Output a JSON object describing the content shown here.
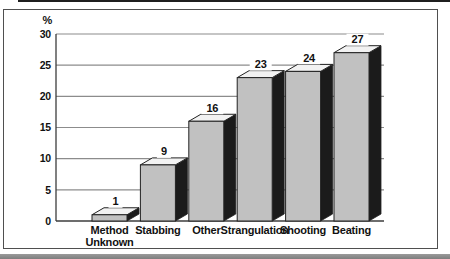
{
  "figure": {
    "kind": "scanned-statistical-figure",
    "y_unit_label": "%"
  },
  "chart_data": {
    "type": "bar",
    "categories": [
      "Method Unknown",
      "Stabbing",
      "Other",
      "Strangulation",
      "Shooting",
      "Beating"
    ],
    "values": [
      1,
      9,
      16,
      23,
      24,
      27
    ],
    "title": "",
    "xlabel": "",
    "ylabel": "%",
    "ylim": [
      0,
      30
    ],
    "yticks": [
      0,
      5,
      10,
      15,
      20,
      25,
      30
    ],
    "grid": true,
    "legend_position": "none",
    "bar_style": "3d-block",
    "value_labels_shown": true,
    "colors": {
      "bar_front": "#c1c1c1",
      "bar_side": "#1b1b1b",
      "bar_top": "#f2f2f2",
      "bar_outline": "#222222",
      "gridline": "#8c8c8c",
      "axis": "#3c3c3c",
      "text": "#111111",
      "frame_border": "#4f4f4f",
      "background": "#ffffff"
    }
  }
}
